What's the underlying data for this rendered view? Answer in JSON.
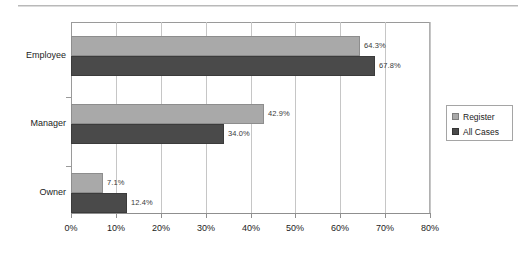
{
  "chart_data": {
    "type": "bar",
    "orientation": "horizontal",
    "title": "",
    "xlabel": "",
    "ylabel": "",
    "categories": [
      "Employee",
      "Manager",
      "Owner"
    ],
    "series": [
      {
        "name": "Register",
        "color": "#a9a9a9",
        "values": [
          64.3,
          42.9,
          7.1
        ],
        "labels": [
          "64.3%",
          "42.9%",
          "7.1%"
        ]
      },
      {
        "name": "All Cases",
        "color": "#4a4a4a",
        "values": [
          67.8,
          34.0,
          12.4
        ],
        "labels": [
          "67.8%",
          "34.0%",
          "12.4%"
        ]
      }
    ],
    "xlim": [
      0,
      80
    ],
    "xticks": [
      0,
      10,
      20,
      30,
      40,
      50,
      60,
      70,
      80
    ],
    "xtick_labels": [
      "0%",
      "10%",
      "20%",
      "30%",
      "40%",
      "50%",
      "60%",
      "70%",
      "80%"
    ],
    "grid": "vertical",
    "legend_position": "right"
  },
  "legend": {
    "items": [
      {
        "label": "Register"
      },
      {
        "label": "All Cases"
      }
    ]
  }
}
